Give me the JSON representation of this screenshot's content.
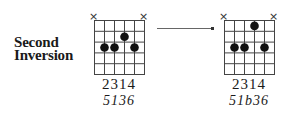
{
  "label": {
    "line1": "Second",
    "line2": "Inversion"
  },
  "chords": [
    {
      "name": "chord-before",
      "muted_strings": [
        "×",
        "×"
      ],
      "dots": [
        {
          "string": 2,
          "fret": 3
        },
        {
          "string": 3,
          "fret": 3
        },
        {
          "string": 4,
          "fret": 2
        },
        {
          "string": 5,
          "fret": 3
        }
      ],
      "fingers": "2314",
      "intervals": "5136"
    },
    {
      "name": "chord-after",
      "muted_strings": [
        "×",
        "×"
      ],
      "dots": [
        {
          "string": 2,
          "fret": 3
        },
        {
          "string": 3,
          "fret": 3
        },
        {
          "string": 4,
          "fret": 1
        },
        {
          "string": 5,
          "fret": 3
        }
      ],
      "fingers": "2314",
      "intervals": "51b36"
    }
  ],
  "arrow": {
    "direction": "right"
  }
}
